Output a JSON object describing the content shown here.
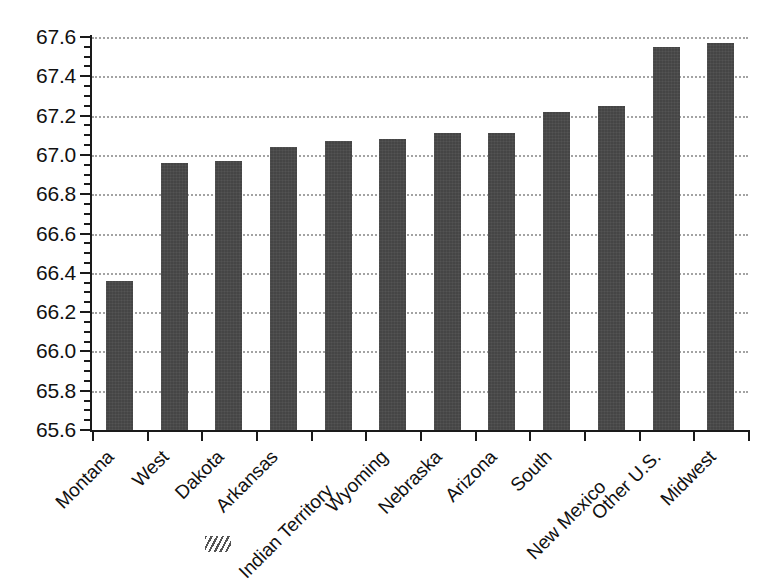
{
  "chart_data": {
    "type": "bar",
    "title": "",
    "subtitle": "",
    "xlabel": "",
    "ylabel": "",
    "ylim": [
      65.6,
      67.6
    ],
    "ytick_step": 0.2,
    "yminor_step": 0.05,
    "grid": true,
    "legend": null,
    "bar_color": "#454545",
    "categories": [
      "Montana",
      "West",
      "Dakota",
      "Arkansas",
      "Indian Territory",
      "Wyoming",
      "Nebraska",
      "Arizona",
      "South",
      "New Mexico",
      "Other U.S.",
      "Midwest"
    ],
    "values": [
      66.36,
      66.96,
      66.97,
      67.04,
      67.07,
      67.08,
      67.11,
      67.11,
      67.22,
      67.25,
      67.55,
      67.57
    ],
    "ytick_labels": [
      "67.6",
      "67.4",
      "67.2",
      "67.0",
      "66.8",
      "66.6",
      "66.4",
      "66.2",
      "66.0",
      "65.8",
      "65.6"
    ],
    "ytick_values": [
      67.6,
      67.4,
      67.2,
      67.0,
      66.8,
      66.6,
      66.4,
      66.2,
      66.0,
      65.8,
      65.6
    ]
  },
  "axes": {
    "y_axis_name": "y-axis",
    "x_axis_name": "x-axis"
  },
  "caption": {
    "ghost_text": ""
  }
}
